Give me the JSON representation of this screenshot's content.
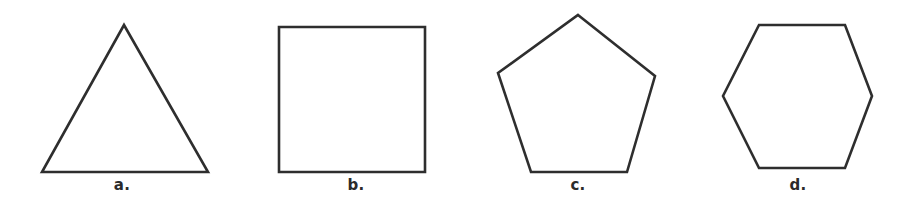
{
  "figure": {
    "background_color": "#ffffff",
    "stroke_color": "#2e2e2e",
    "width": 908,
    "height": 206
  },
  "shapes": [
    {
      "key": "triangle",
      "name": "triangle",
      "label": "a.",
      "sides": 3,
      "label_x": 122,
      "label_y": 178,
      "points": "124,25 208,172 42,172"
    },
    {
      "key": "square",
      "name": "square",
      "label": "b.",
      "sides": 4,
      "label_x": 356,
      "label_y": 178,
      "points": "279,27 425,27 425,172 279,172"
    },
    {
      "key": "pentagon",
      "name": "pentagon",
      "label": "c.",
      "sides": 5,
      "label_x": 578,
      "label_y": 178,
      "points": "578,15 655,76 627,172 531,172 498,73"
    },
    {
      "key": "hexagon",
      "name": "hexagon",
      "label": "d.",
      "sides": 6,
      "label_x": 798,
      "label_y": 178,
      "points": "759,25 845,25 872,96 845,168 759,168 723,96"
    }
  ]
}
